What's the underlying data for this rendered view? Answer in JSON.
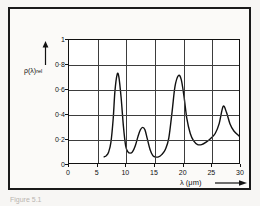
{
  "figure": {
    "caption": "Figure 5.1",
    "y_axis_label_main": "ρ(λ)",
    "y_axis_label_sub": "rel",
    "x_axis_label": "λ (μm)",
    "x_arrow_icon": "right-arrow-icon",
    "y_arrow_icon": "up-arrow-icon"
  },
  "chart_data": {
    "type": "line",
    "title": "",
    "xlabel": "λ (μm)",
    "ylabel": "ρ(λ) rel",
    "xlim": [
      0,
      30
    ],
    "ylim": [
      0,
      1
    ],
    "grid": true,
    "legend": null,
    "xticks": [
      0,
      5,
      10,
      15,
      20,
      25,
      30
    ],
    "xtick_labels": [
      "0",
      "5",
      "10",
      "15",
      "20",
      "25",
      "30"
    ],
    "yticks": [
      0,
      0.2,
      0.4,
      0.6,
      0.8,
      1
    ],
    "ytick_labels": [
      "0",
      "0·2",
      "0·4",
      "0·6",
      "0·8",
      "1"
    ],
    "series": [
      {
        "name": "relative spectral reflectance",
        "color": "#111111",
        "x": [
          6.2,
          6.6,
          7.0,
          7.4,
          7.8,
          8.1,
          8.5,
          8.8,
          9.2,
          9.6,
          10.0,
          10.4,
          10.8,
          11.2,
          11.7,
          12.2,
          12.6,
          13.0,
          13.4,
          13.8,
          14.3,
          14.8,
          15.2,
          15.8,
          16.4,
          17.0,
          17.6,
          18.2,
          18.7,
          19.3,
          19.8,
          20.3,
          20.8,
          21.4,
          22.0,
          22.7,
          23.4,
          24.2,
          25.0,
          25.8,
          26.5,
          27.2,
          27.8,
          28.4,
          29.1,
          30.0
        ],
        "y": [
          0.05,
          0.06,
          0.09,
          0.17,
          0.36,
          0.58,
          0.72,
          0.7,
          0.53,
          0.3,
          0.14,
          0.09,
          0.08,
          0.09,
          0.14,
          0.22,
          0.27,
          0.29,
          0.27,
          0.2,
          0.11,
          0.06,
          0.05,
          0.05,
          0.07,
          0.11,
          0.2,
          0.42,
          0.62,
          0.71,
          0.68,
          0.54,
          0.36,
          0.24,
          0.18,
          0.15,
          0.15,
          0.17,
          0.2,
          0.24,
          0.32,
          0.46,
          0.41,
          0.32,
          0.26,
          0.22
        ]
      }
    ],
    "peaks": [
      {
        "lambda_um": 8.5,
        "value": 0.72
      },
      {
        "lambda_um": 13.0,
        "value": 0.29
      },
      {
        "lambda_um": 19.3,
        "value": 0.71
      },
      {
        "lambda_um": 27.2,
        "value": 0.46
      }
    ],
    "minima": [
      {
        "lambda_um": 10.9,
        "value": 0.08
      },
      {
        "lambda_um": 15.2,
        "value": 0.05
      },
      {
        "lambda_um": 23.4,
        "value": 0.15
      }
    ]
  }
}
